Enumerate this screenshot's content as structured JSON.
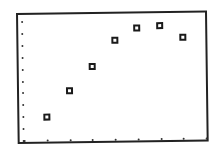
{
  "chart_data": {
    "type": "scatter",
    "title": "",
    "xlabel": "",
    "ylabel": "",
    "grid": false,
    "legend": null,
    "marker": "hollow-square",
    "axis_ticks": {
      "x_count": 9,
      "y_count": 11,
      "style": "dots-along-bottom-and-left-edge"
    },
    "xlim": [
      0,
      8
    ],
    "ylim": [
      0,
      10
    ],
    "x": [
      1,
      2,
      3,
      4,
      5,
      6,
      7
    ],
    "y": [
      2.0,
      4.2,
      6.2,
      8.4,
      9.4,
      9.5,
      8.5
    ],
    "series": [
      {
        "name": "data",
        "points": [
          {
            "x": 1,
            "y": 2.0
          },
          {
            "x": 2,
            "y": 4.2
          },
          {
            "x": 3,
            "y": 6.2
          },
          {
            "x": 4,
            "y": 8.4
          },
          {
            "x": 5,
            "y": 9.4
          },
          {
            "x": 6,
            "y": 9.5
          },
          {
            "x": 7,
            "y": 8.5
          }
        ]
      }
    ]
  },
  "style": {
    "frame_color": "#222222",
    "marker_color": "#1a1a1a",
    "background": "#ffffff"
  }
}
